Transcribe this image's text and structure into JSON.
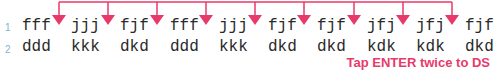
{
  "accent_color": "#e83a6a",
  "lines": [
    {
      "number": "1",
      "groups": [
        "fff",
        "jjj",
        "fjf",
        "fff",
        "jjj",
        "fjf",
        "fjf",
        "jfj",
        "jfj",
        "fjf"
      ]
    },
    {
      "number": "2",
      "groups": [
        "ddd",
        "kkk",
        "dkd",
        "ddd",
        "kkk",
        "dkd",
        "dkd",
        "kdk",
        "kdk",
        "dkd"
      ]
    }
  ],
  "hint": "Tap ENTER twice to DS",
  "arrow_icon": "down-arrow-icon"
}
